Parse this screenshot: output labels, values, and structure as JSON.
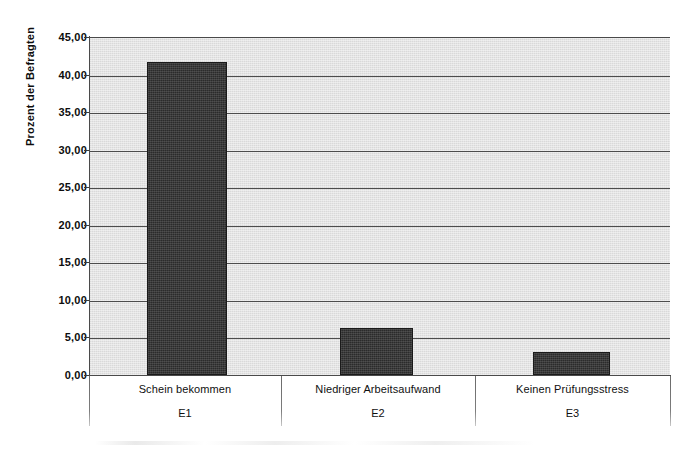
{
  "chart_data": {
    "type": "bar",
    "title": "",
    "subtitle": "",
    "xlabel": "",
    "ylabel": "Prozent der Befragten",
    "categories": [
      "Schein bekommen",
      "Niedriger Arbeitsaufwand",
      "Keinen Prüfungsstress"
    ],
    "category_codes": [
      "E1",
      "E2",
      "E3"
    ],
    "values": [
      41.7,
      6.2,
      3.1
    ],
    "ylim": [
      0,
      45
    ],
    "ytick_step": 5,
    "ytick_labels": [
      "45,00",
      "40,00",
      "35,00",
      "30,00",
      "25,00",
      "20,00",
      "15,00",
      "10,00",
      "5,00",
      "0,00"
    ],
    "ytick_values": [
      45,
      40,
      35,
      30,
      25,
      20,
      15,
      10,
      5,
      0
    ],
    "grid": true,
    "legend": false,
    "legend_position": "none",
    "decimal_separator": ",",
    "colors": {
      "bar": "#2b2b2b",
      "plot_background": "#d9d9d9",
      "gridline": "#4d4d4d",
      "axis": "#4a4a4a",
      "text": "#101010",
      "page_background": "#ffffff"
    }
  },
  "axis": {
    "y_title": "Prozent der Befragten"
  },
  "bars": [
    {
      "code": "E1",
      "name": "Schein bekommen",
      "value": 41.7
    },
    {
      "code": "E2",
      "name": "Niedriger Arbeitsaufwand",
      "value": 6.2
    },
    {
      "code": "E3",
      "name": "Keinen Prüfungsstress",
      "value": 3.1
    }
  ],
  "yticks": [
    {
      "label": "45,00",
      "value": 45
    },
    {
      "label": "40,00",
      "value": 40
    },
    {
      "label": "35,00",
      "value": 35
    },
    {
      "label": "30,00",
      "value": 30
    },
    {
      "label": "25,00",
      "value": 25
    },
    {
      "label": "20,00",
      "value": 20
    },
    {
      "label": "15,00",
      "value": 15
    },
    {
      "label": "10,00",
      "value": 10
    },
    {
      "label": "5,00",
      "value": 5
    },
    {
      "label": "0,00",
      "value": 0
    }
  ]
}
